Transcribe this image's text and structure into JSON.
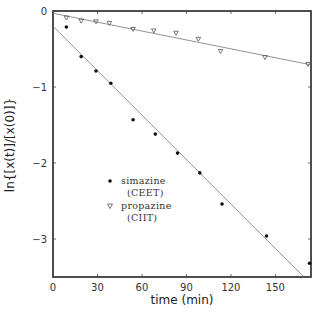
{
  "chart_data": {
    "type": "scatter",
    "title": "",
    "xlabel": "time (min)",
    "ylabel": "ln{[x(t)]/[x(0)]}",
    "xlim": [
      0,
      174
    ],
    "ylim": [
      -3.5,
      0
    ],
    "xticks": [
      0,
      30,
      60,
      90,
      120,
      150
    ],
    "yticks": [
      0,
      -1,
      -2,
      -3
    ],
    "xtick_labels": [
      "0",
      "30",
      "60",
      "90",
      "120",
      "150"
    ],
    "ytick_labels": [
      "0",
      "−1",
      "−2",
      "−3"
    ],
    "grid": false,
    "legend_position": "center-left",
    "series": [
      {
        "name": "simazine",
        "label_line2": "(CEET)",
        "marker": "filled-circle",
        "x": [
          9,
          19,
          29,
          39,
          54,
          69,
          84,
          99,
          114,
          144,
          173
        ],
        "y": [
          -0.21,
          -0.6,
          -0.79,
          -0.95,
          -1.43,
          -1.62,
          -1.87,
          -2.13,
          -2.54,
          -2.96,
          -3.32
        ],
        "fit": {
          "slope": -0.0195,
          "intercept": -0.2
        }
      },
      {
        "name": "propazine",
        "label_line2": "(CIIT)",
        "marker": "open-down-triangle",
        "x": [
          9,
          19,
          29,
          38,
          54,
          68,
          83,
          98,
          113,
          143,
          172
        ],
        "y": [
          -0.09,
          -0.13,
          -0.14,
          -0.16,
          -0.24,
          -0.26,
          -0.29,
          -0.37,
          -0.53,
          -0.61,
          -0.7
        ],
        "fit": {
          "slope": -0.0039,
          "intercept": -0.03
        }
      }
    ]
  },
  "axes": {
    "xlabel": "time (min)",
    "ylabel": "ln{[x(t)]/[x(0)]}"
  },
  "legend": {
    "items": [
      {
        "line1": "simazine",
        "line2": "(CEET)"
      },
      {
        "line1": "propazine",
        "line2": "(CIIT)"
      }
    ]
  }
}
